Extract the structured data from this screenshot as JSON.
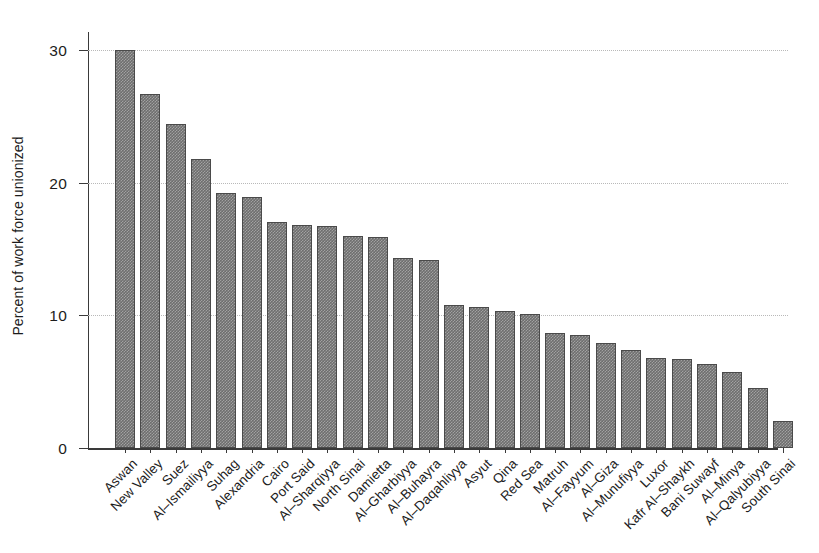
{
  "chart_data": {
    "type": "bar",
    "title": "",
    "xlabel": "",
    "ylabel": "Percent of work force unionized",
    "ylim": [
      0,
      31.5
    ],
    "yticks": [
      0,
      10,
      20,
      30
    ],
    "ytick_labels": [
      "0",
      "10",
      "20",
      "30"
    ],
    "grid": "horizontal-dotted",
    "legend": "none",
    "bar_color": "#6e6e6e",
    "bar_edge_color": "#4a4a4a",
    "axis_color": "#3a3a3a",
    "gridline_color": "#b9b9b9",
    "categories": [
      "Aswan",
      "New Valley",
      "Suez",
      "Al–Ismailiyya",
      "Suhag",
      "Alexandria",
      "Cairo",
      "Port Said",
      "Al–Sharqiyya",
      "North Sinai",
      "Damietta",
      "Al–Gharbiyya",
      "Al–Buhayra",
      "Al–Daqahliyya",
      "Asyut",
      "Qina",
      "Red Sea",
      "Matruh",
      "Al–Fayyum",
      "Al–Giza",
      "Al–Munufiyya",
      "Luxor",
      "Kafr Al–Shaykh",
      "Bani Suwayf",
      "Al–Minya",
      "Al–Qalyubiyya",
      "South Sinai"
    ],
    "values": [
      30.0,
      26.7,
      24.4,
      21.8,
      19.2,
      18.9,
      17.0,
      16.8,
      16.7,
      16.0,
      15.9,
      14.3,
      14.2,
      10.8,
      10.6,
      10.3,
      10.1,
      8.7,
      8.5,
      7.9,
      7.4,
      6.8,
      6.7,
      6.3,
      5.7,
      4.5,
      2.0
    ]
  }
}
